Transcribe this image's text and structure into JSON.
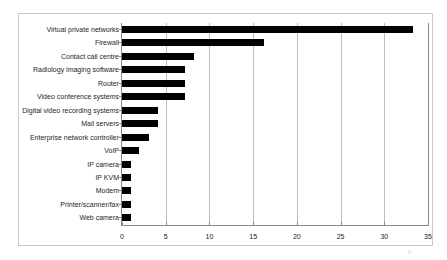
{
  "chart_data": {
    "type": "bar",
    "orientation": "horizontal",
    "title": "",
    "subtitle": "",
    "xlabel": "",
    "ylabel": "",
    "xlim": [
      0,
      35
    ],
    "xticks": [
      0,
      5,
      10,
      15,
      20,
      25,
      30,
      35
    ],
    "xtick_labels": [
      "0",
      "5",
      "10",
      "15",
      "20",
      "25",
      "30",
      "35"
    ],
    "grid": true,
    "grid_axis": "x",
    "legend": false,
    "legend_position": "none",
    "bar_color": "#000000",
    "categories": [
      "Virtual private networks",
      "Firewall",
      "Contact call centre",
      "Radiology imaging software",
      "Router",
      "Video conference systems",
      "Digital video recording systems",
      "Mail servers",
      "Enterprise network controller",
      "VoIP",
      "IP camera",
      "IP KVM",
      "Modem",
      "Printer/scanner/fax",
      "Web camera"
    ],
    "values": [
      33.3,
      16.2,
      8.2,
      7.2,
      7.2,
      7.2,
      4.1,
      4.1,
      3.1,
      2.0,
      1.0,
      1.0,
      1.0,
      1.0,
      1.0
    ]
  },
  "figure": {
    "border_color": "#c9c9c9",
    "axis_color": "#8a8a8a",
    "gridline_color": "#bdbdbd",
    "background": "#ffffff",
    "artifact_mark": "ρ"
  }
}
